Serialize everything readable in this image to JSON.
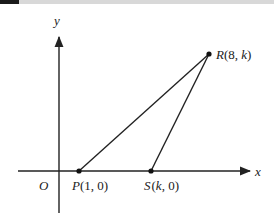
{
  "figure": {
    "axes": {
      "x_label": "x",
      "y_label": "y",
      "origin_label": "O"
    },
    "points": [
      {
        "id": "P",
        "label_name": "P",
        "label_coords": "(1, 0)"
      },
      {
        "id": "S",
        "label_name": "S",
        "label_coords_open": "(",
        "label_coords_var": "k",
        "label_coords_close": ", 0)"
      },
      {
        "id": "R",
        "label_name": "R",
        "label_coords_open": "(8, ",
        "label_coords_var": "k",
        "label_coords_close": ")"
      }
    ],
    "segments": [
      "PR",
      "SR"
    ],
    "colors": {
      "line": "#222222",
      "topbar": "#d8d8d8",
      "topbar_accent": "#1a1a1a"
    }
  }
}
